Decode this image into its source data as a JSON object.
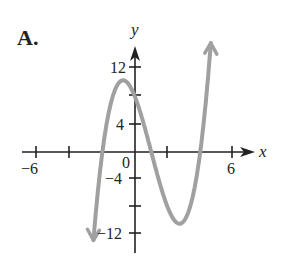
{
  "panel_label": "A.",
  "chart_data": {
    "type": "line",
    "title": "A.",
    "xlabel": "x",
    "ylabel": "y",
    "function": "(x+2)(x-1)(x-4)",
    "x_ticks": [
      -6,
      -4,
      -2,
      0,
      2,
      4,
      6
    ],
    "x_tick_labels": {
      "-6": "-6",
      "6": "6",
      "0": "0"
    },
    "y_ticks": [
      -12,
      -8,
      -4,
      0,
      4,
      8,
      12
    ],
    "y_tick_labels": {
      "12": "12",
      "4": "4",
      "-4": "-4",
      "-12": "-12"
    },
    "xlim": [
      -6.5,
      7
    ],
    "ylim": [
      -14,
      16
    ],
    "grid": false,
    "roots": [
      -2,
      1,
      4
    ],
    "local_max": [
      -0.8,
      10.5
    ],
    "local_min": [
      2.8,
      -10.1
    ],
    "y_intercept": 8,
    "curve_color": "#a0a0a0",
    "axis_color": "#222222"
  },
  "labels": {
    "x_axis": "x",
    "y_axis": "y",
    "neg6": "−6",
    "pos6": "6",
    "zero": "0",
    "y12": "12",
    "y4": "4",
    "yneg4": "−4",
    "yneg12": "−12"
  }
}
